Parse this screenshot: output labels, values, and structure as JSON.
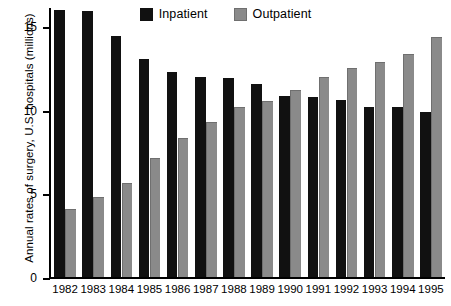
{
  "chart_data": {
    "type": "bar",
    "title": "",
    "xlabel": "",
    "ylabel": "Annual rates of surgery, U.S. hospitals (millions)",
    "categories": [
      "1982",
      "1983",
      "1984",
      "1985",
      "1986",
      "1987",
      "1988",
      "1989",
      "1990",
      "1991",
      "1992",
      "1993",
      "1994",
      "1995"
    ],
    "series": [
      {
        "name": "Inpatient",
        "color": "#111111",
        "values": [
          16.0,
          15.9,
          14.4,
          13.05,
          12.25,
          11.95,
          11.9,
          11.55,
          10.85,
          10.8,
          10.6,
          10.2,
          10.15,
          9.85
        ]
      },
      {
        "name": "Outpatient",
        "color": "#8a8a8a",
        "values": [
          4.05,
          4.8,
          5.6,
          7.1,
          8.3,
          9.3,
          10.2,
          10.55,
          11.2,
          11.95,
          12.5,
          12.85,
          13.35,
          14.35
        ]
      }
    ],
    "ylim": [
      0,
      16.1
    ],
    "yticks": [
      0,
      5,
      10,
      15
    ],
    "ytick_labels": [
      "0",
      "5",
      "10",
      "15"
    ],
    "grid": false,
    "legend_position": "top-center"
  },
  "legend": {
    "entries": [
      {
        "label": "Inpatient",
        "color": "#111111",
        "swatch_name": "legend-swatch-inpatient"
      },
      {
        "label": "Outpatient",
        "color": "#8a8a8a",
        "swatch_name": "legend-swatch-outpatient"
      }
    ]
  }
}
